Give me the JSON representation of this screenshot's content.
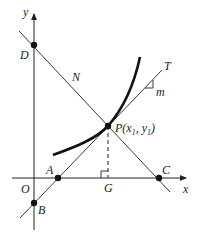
{
  "diagram": {
    "type": "geometry-tangent-normal",
    "axes": {
      "x_label": "x",
      "y_label": "y",
      "origin_label": "O"
    },
    "points": {
      "D": "D",
      "N": "N",
      "T": "T",
      "m": "m",
      "P": "P(x",
      "P_sub1": "1",
      "P_mid": ", y",
      "P_sub2": "1",
      "P_close": ")",
      "A": "A",
      "B": "B",
      "C": "C",
      "G": "G"
    },
    "colors": {
      "stroke": "#222222",
      "curve": "#111111",
      "background": "#ffffff"
    }
  }
}
